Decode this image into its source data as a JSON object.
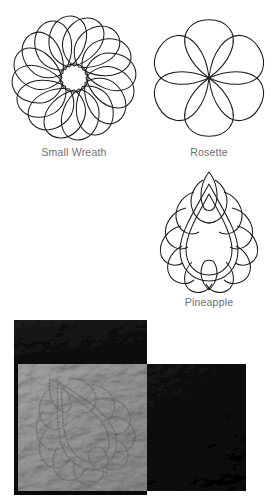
{
  "document": {
    "type": "quilting-pattern-reference",
    "motifs": [
      {
        "id": "small-wreath",
        "label": "Small Wreath",
        "shape": "spiral-wreath",
        "petal_count": 16,
        "has_center_circle": true,
        "stroke_color": "#1d1d1d",
        "fill_color": "#ffffff"
      },
      {
        "id": "rosette",
        "label": "Rosette",
        "shape": "radiating-petals",
        "petal_count": 6,
        "has_center_circle": false,
        "stroke_color": "#1d1d1d",
        "fill_color": "#ffffff"
      },
      {
        "id": "pineapple",
        "label": "Pineapple",
        "shape": "layered-teardrop",
        "petal_count": 16,
        "has_center_circle": false,
        "stroke_color": "#1d1d1d",
        "fill_color": "#ffffff"
      }
    ],
    "photo": {
      "caption": "",
      "description": "Quilted fabric sample showing the Pineapple motif stitched into a light grey square bordered by dark fabric patches",
      "motif_shown": "pineapple",
      "colors": {
        "dark_fabric": "#161616",
        "dark_fabric_alt": "#111111",
        "light_fabric": "#9a9a9a",
        "light_fabric_shadow": "#7d7d7d",
        "light_fabric_highlight": "#b4b4b4",
        "border": "#0c0c0c"
      }
    },
    "caption_color": "#6f6f6f",
    "background_color": "#ffffff"
  }
}
